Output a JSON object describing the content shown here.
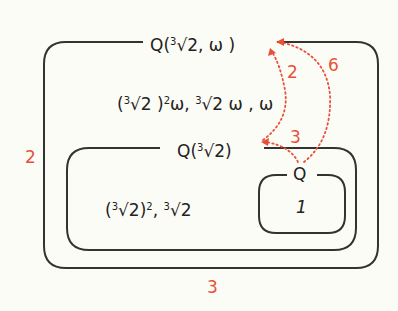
{
  "colors": {
    "background": "#fcfcf6",
    "box_stroke": "#333333",
    "degree": "#e8503a"
  },
  "fields": {
    "outer": {
      "name": "Q(∛2, ω)",
      "name_parts": {
        "pre": "Q(",
        "root_index": "3",
        "radical": "√2",
        "post": ", ω )"
      },
      "elements": "(∛2)²ω, ∛2ω, ω",
      "elements_parts": {
        "a_open": "(",
        "a_idx": "3",
        "a_rad": "√2",
        "a_close": " )",
        "a_pow": "2",
        "a_tail": "ω, ",
        "b_idx": "3",
        "b_rad": "√2",
        "b_tail": " ω , ω"
      }
    },
    "middle": {
      "name": "Q(∛2)",
      "name_parts": {
        "pre": "Q(",
        "root_index": "3",
        "radical": "√2",
        "post": ")"
      },
      "elements": "(∛2)², ∛2",
      "elements_parts": {
        "a_open": "(",
        "a_idx": "3",
        "a_rad": "√2",
        "a_close": ")",
        "a_pow": "2",
        "sep": ", ",
        "b_idx": "3",
        "b_rad": "√2"
      }
    },
    "inner": {
      "name": "Q",
      "elements": "1"
    }
  },
  "degrees": {
    "outer_over_middle_side": "2",
    "middle_over_base_bottom": "3",
    "arrow_middle_to_outer": "2",
    "arrow_base_to_middle": "3",
    "arrow_base_to_outer": "6"
  }
}
